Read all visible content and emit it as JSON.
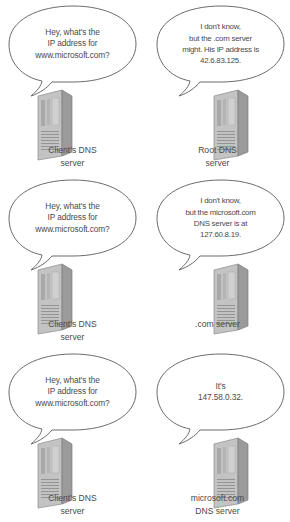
{
  "diagram": {
    "background_color": "#ffffff",
    "bubble_stroke": "#6b6b6b",
    "text_color": "#4a4a4a",
    "server_body_color": "#b9b9b9",
    "server_side_color": "#8e8e8e",
    "rows": [
      {
        "id": "row-root",
        "left": {
          "bubble": "Hey, what's the\nIP address for\nwww.microsoft.com?",
          "caption": "Client's DNS\nserver",
          "icon": "server-tower-icon"
        },
        "right": {
          "bubble": "I don't know,\nbut the .com server\nmight. His IP address is\n42.6.83.125.",
          "caption": "Root DNS\nserver",
          "icon": "server-tower-icon"
        }
      },
      {
        "id": "row-com",
        "left": {
          "bubble": "Hey, what's the\nIP address for\nwww.microsoft.com?",
          "caption": "Client's DNS\nserver",
          "icon": "server-tower-icon"
        },
        "right": {
          "bubble": "I don't know,\nbut the microsoft.com\nDNS server is at\n127.60.8.19.",
          "caption": ".com server",
          "icon": "server-tower-icon"
        }
      },
      {
        "id": "row-microsoft",
        "left": {
          "bubble": "Hey, what's the\nIP address for\nwww.microsoft.com?",
          "caption": "Client's DNS\nserver",
          "icon": "server-tower-icon"
        },
        "right": {
          "bubble": "It's\n147.58.0.32.",
          "caption": "microsoft.com\nDNS server",
          "icon": "server-tower-icon"
        }
      }
    ]
  }
}
